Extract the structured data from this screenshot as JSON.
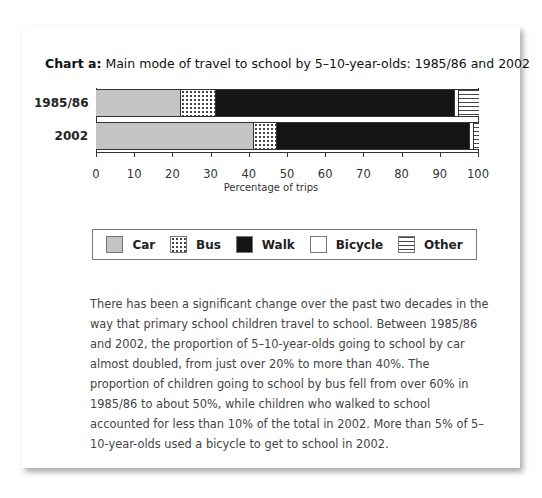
{
  "chart_data": {
    "type": "bar",
    "orientation": "horizontal",
    "stacked": true,
    "title_prefix": "Chart a:",
    "title": "Main mode of travel to school by 5–10-year-olds: 1985/86 and 2002",
    "categories": [
      "1985/86",
      "2002"
    ],
    "series": [
      {
        "name": "Car",
        "values": [
          22,
          41
        ],
        "pattern": "light-grey",
        "color": "#c4c4c4"
      },
      {
        "name": "Bus",
        "values": [
          9,
          6
        ],
        "pattern": "dotted",
        "color": "#ffffff"
      },
      {
        "name": "Walk",
        "values": [
          62.5,
          50.5
        ],
        "pattern": "black",
        "color": "#151515"
      },
      {
        "name": "Bicycle",
        "values": [
          1,
          1
        ],
        "pattern": "white",
        "color": "#ffffff"
      },
      {
        "name": "Other",
        "values": [
          5.5,
          1.5
        ],
        "pattern": "horizontal-lines",
        "color": "#ffffff"
      }
    ],
    "xlabel": "Percentage of trips",
    "ylabel": "",
    "xlim": [
      0,
      100
    ],
    "x_ticks": [
      0,
      10,
      20,
      30,
      40,
      50,
      60,
      70,
      80,
      90,
      100
    ],
    "grid": false,
    "legend_position": "bottom"
  },
  "title": {
    "prefix": "Chart a:",
    "text": " Main mode of travel to school by 5–10-year-olds: 1985/86 and 2002"
  },
  "bars": [
    {
      "label": "1985/86",
      "segments": [
        {
          "name": "Car",
          "value": 22,
          "cls": "pat-car"
        },
        {
          "name": "Bus",
          "value": 9,
          "cls": "pat-bus"
        },
        {
          "name": "Walk",
          "value": 62.5,
          "cls": "pat-walk"
        },
        {
          "name": "Bicycle",
          "value": 1,
          "cls": "pat-bicycle"
        },
        {
          "name": "Other",
          "value": 5.5,
          "cls": "pat-other"
        }
      ]
    },
    {
      "label": "2002",
      "segments": [
        {
          "name": "Car",
          "value": 41,
          "cls": "pat-car"
        },
        {
          "name": "Bus",
          "value": 6,
          "cls": "pat-bus"
        },
        {
          "name": "Walk",
          "value": 50.5,
          "cls": "pat-walk"
        },
        {
          "name": "Bicycle",
          "value": 1,
          "cls": "pat-bicycle"
        },
        {
          "name": "Other",
          "value": 1.5,
          "cls": "pat-other"
        }
      ]
    }
  ],
  "x_axis": {
    "ticks": [
      "0",
      "10",
      "20",
      "30",
      "40",
      "50",
      "60",
      "70",
      "80",
      "90",
      "100"
    ],
    "title": "Percentage of trips"
  },
  "legend": [
    {
      "label": "Car",
      "cls": "pat-car"
    },
    {
      "label": "Bus",
      "cls": "pat-bus"
    },
    {
      "label": "Walk",
      "cls": "pat-walk"
    },
    {
      "label": "Bicycle",
      "cls": "pat-bicycle"
    },
    {
      "label": "Other",
      "cls": "pat-other"
    }
  ],
  "paragraph": "There has been a significant change over the past two decades in the way that primary school children travel to school. Between 1985/86 and 2002, the proportion of 5–10-year-olds going to school by car almost doubled, from just over 20% to more than 40%. The proportion of children going to school by bus fell from over 60% in 1985/86 to about 50%, while children who walked to school accounted for less than 10% of the total in 2002. More than 5% of 5–10-year-olds used a bicycle to get to school in 2002."
}
